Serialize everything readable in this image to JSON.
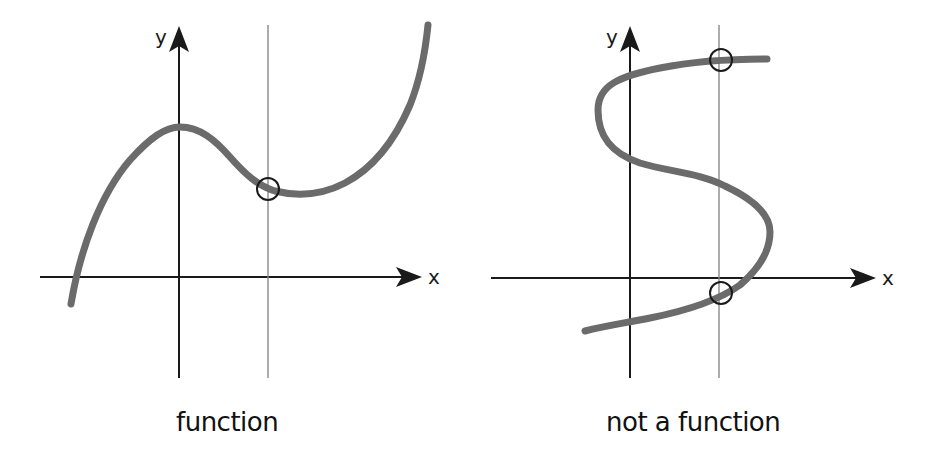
{
  "diagram": {
    "panels": [
      {
        "id": "left",
        "caption": "function",
        "axis_labels": {
          "x": "x",
          "y": "y"
        },
        "vertical_test_line": {
          "x": 268
        },
        "intersections": 1,
        "curve_shape": "cubic (rises, local max at y-axis, local min, then rises steeply)"
      },
      {
        "id": "right",
        "caption": "not a function",
        "axis_labels": {
          "x": "x",
          "y": "y"
        },
        "vertical_test_line": {
          "x": 720
        },
        "intersections": 2,
        "curve_shape": "S-shaped curve (fails vertical line test)"
      }
    ],
    "colors": {
      "axis": "#1a1a1a",
      "curve": "#6b6b6b",
      "test_line": "#8a8a8a",
      "marker": "#1a1a1a",
      "background": "#ffffff"
    }
  }
}
